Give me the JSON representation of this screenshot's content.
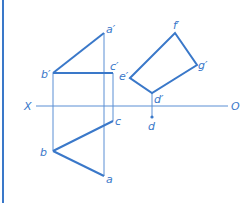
{
  "diagram": {
    "type": "orthographic-projection",
    "colors": {
      "line": "#3a78c9",
      "thin": "#5a8fd4",
      "background": "#ffffff"
    },
    "axis": {
      "left_label": "X",
      "right_label": "O"
    },
    "points": {
      "a_prime": "a′",
      "b_prime": "b′",
      "c_prime": "c′",
      "e_prime": "e′",
      "f_prime": "f′",
      "g_prime": "g′",
      "d_prime": "d′",
      "a": "a",
      "b": "b",
      "c": "c",
      "d": "d"
    }
  }
}
